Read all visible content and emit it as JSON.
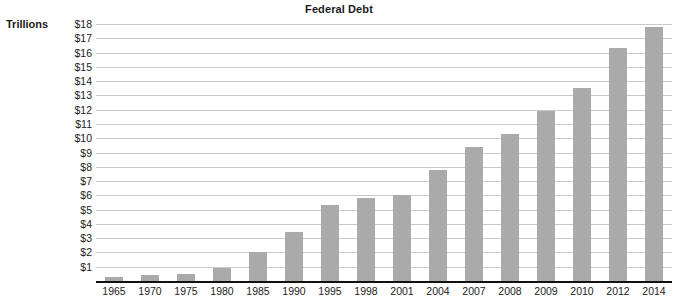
{
  "chart_data": {
    "type": "bar",
    "title": "Federal Debt",
    "subtitle": "",
    "xlabel": "",
    "ylabel": "Trillions",
    "ylim": [
      0,
      18
    ],
    "ytick_labels": [
      "$18",
      "$17",
      "$16",
      "$15",
      "$14",
      "$13",
      "$12",
      "$11",
      "$10",
      "$9",
      "$8",
      "$7",
      "$6",
      "$5",
      "$4",
      "$3",
      "$2",
      "$1"
    ],
    "ytick_values": [
      18,
      17,
      16,
      15,
      14,
      13,
      12,
      11,
      10,
      9,
      8,
      7,
      6,
      5,
      4,
      3,
      2,
      1
    ],
    "grid": true,
    "legend": "none",
    "categories": [
      "1965",
      "1970",
      "1975",
      "1980",
      "1985",
      "1990",
      "1995",
      "1998",
      "2001",
      "2004",
      "2007",
      "2008",
      "2009",
      "2010",
      "2012",
      "2014"
    ],
    "values": [
      0.3,
      0.4,
      0.5,
      0.9,
      2.0,
      3.4,
      5.3,
      5.8,
      6.0,
      7.8,
      9.4,
      10.3,
      11.9,
      13.5,
      16.3,
      17.8
    ],
    "bar_color": "#aaaaaa",
    "grid_color": "#c9c9c9",
    "axis_color": "#111111",
    "background_color": "#ffffff"
  }
}
